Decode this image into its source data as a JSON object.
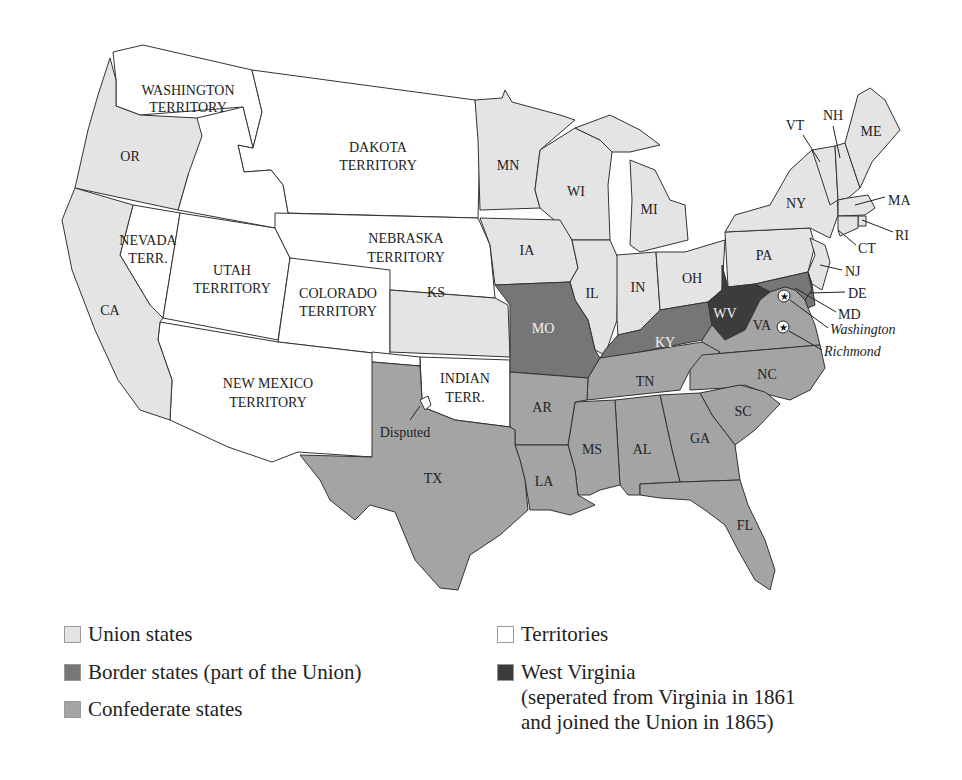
{
  "colors": {
    "union": "#e4e4e4",
    "border": "#767676",
    "confederate": "#a4a4a4",
    "territory": "#ffffff",
    "west_virginia": "#3c3c3c",
    "outline": "#333333"
  },
  "map": {
    "territories": {
      "washington": "WASHINGTON",
      "washington2": "TERRITORY",
      "dakota": "DAKOTA",
      "dakota2": "TERRITORY",
      "nevada": "NEVADA",
      "nevada2": "TERR.",
      "utah": "UTAH",
      "utah2": "TERRITORY",
      "colorado": "COLORADO",
      "colorado2": "TERRITORY",
      "nebraska": "NEBRASKA",
      "nebraska2": "TERRITORY",
      "new_mexico": "NEW MEXICO",
      "new_mexico2": "TERRITORY",
      "indian": "INDIAN",
      "indian2": "TERR."
    },
    "union_states": [
      "OR",
      "CA",
      "MN",
      "WI",
      "MI",
      "IA",
      "IL",
      "IN",
      "OH",
      "PA",
      "NY",
      "NJ",
      "VT",
      "NH",
      "ME",
      "MA",
      "RI",
      "CT",
      "KS"
    ],
    "border_states": [
      "MO",
      "KY",
      "MD",
      "DE"
    ],
    "confederate_states": [
      "TX",
      "AR",
      "LA",
      "MS",
      "AL",
      "GA",
      "FL",
      "TN",
      "NC",
      "SC",
      "VA"
    ],
    "west_virginia": "WV",
    "labels": {
      "OR": "OR",
      "CA": "CA",
      "MN": "MN",
      "WI": "WI",
      "MI": "MI",
      "IA": "IA",
      "IL": "IL",
      "IN": "IN",
      "OH": "OH",
      "PA": "PA",
      "NY": "NY",
      "NJ": "NJ",
      "VT": "VT",
      "NH": "NH",
      "ME": "ME",
      "MA": "MA",
      "RI": "RI",
      "CT": "CT",
      "DE": "DE",
      "MD": "MD",
      "KS": "KS",
      "MO": "MO",
      "KY": "KY",
      "WV": "WV",
      "VA": "VA",
      "TN": "TN",
      "NC": "NC",
      "SC": "SC",
      "GA": "GA",
      "AL": "AL",
      "MS": "MS",
      "AR": "AR",
      "LA": "LA",
      "TX": "TX",
      "FL": "FL"
    },
    "annotations": {
      "disputed": "Disputed",
      "washington_city": "Washington",
      "richmond_city": "Richmond"
    },
    "capitals": [
      "Washington",
      "Richmond"
    ]
  },
  "legend": {
    "items": [
      {
        "label": "Union states",
        "key": "union"
      },
      {
        "label": "Border states (part of the Union)",
        "key": "border"
      },
      {
        "label": "Confederate states",
        "key": "confederate"
      },
      {
        "label": "Territories",
        "key": "territory"
      },
      {
        "label": "West Virginia\n(seperated from Virginia in 1861\nand joined the Union in 1865)",
        "key": "west_virginia"
      }
    ]
  }
}
